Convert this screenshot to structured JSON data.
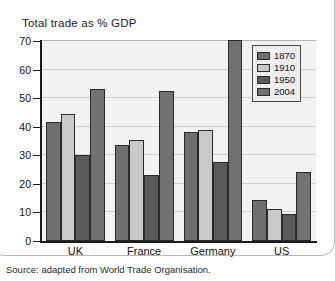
{
  "figure": {
    "title": "Total trade as % GDP",
    "source_note": "Source: adapted from World Trade Organisation."
  },
  "chart_data": {
    "type": "bar",
    "title": "Total trade as % GDP",
    "xlabel": "",
    "ylabel": "",
    "ylim": [
      0,
      70
    ],
    "yticks": [
      0,
      10,
      20,
      30,
      40,
      50,
      60,
      70
    ],
    "grid": true,
    "legend_position": "top-right",
    "categories": [
      "UK",
      "France",
      "Germany",
      "US"
    ],
    "series": [
      {
        "name": "1870",
        "color": "#6f6f6f",
        "values": [
          41.5,
          33.5,
          38.0,
          14.5
        ]
      },
      {
        "name": "1910",
        "color": "#c9c9c9",
        "values": [
          44.5,
          35.5,
          38.7,
          11.3
        ]
      },
      {
        "name": "1950",
        "color": "#5a5a5a",
        "values": [
          30.2,
          23.2,
          27.5,
          9.3
        ]
      },
      {
        "name": "2004",
        "color": "#717171",
        "values": [
          53.3,
          52.6,
          70.2,
          24.0
        ]
      }
    ],
    "annotations": [
      "Source: adapted from World Trade Organisation."
    ]
  }
}
